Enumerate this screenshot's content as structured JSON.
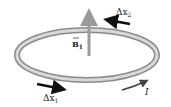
{
  "diagram": {
    "labels": {
      "field": "B",
      "field_subscript": "1",
      "segment_1": "Δx",
      "segment_1_subscript": "1",
      "segment_2": "Δx",
      "segment_2_subscript": "2",
      "current": "I"
    },
    "colors": {
      "loop_outer": "#8a8a8a",
      "loop_inner": "#d8d8d8",
      "field_arrow": "#9a9a9a",
      "segment_arrow": "#111111",
      "current_arrow": "#444444"
    }
  }
}
